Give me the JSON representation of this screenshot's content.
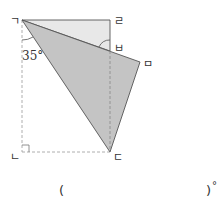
{
  "diagram": {
    "type": "folded-rectangle",
    "vertices": {
      "g": {
        "label": "ㄱ",
        "x": 22,
        "y": 20
      },
      "r": {
        "label": "ㄹ",
        "x": 110,
        "y": 20
      },
      "b": {
        "label": "ㅂ",
        "x": 110,
        "y": 51
      },
      "m": {
        "label": "ㅁ",
        "x": 140,
        "y": 62
      },
      "d": {
        "label": "ㄷ",
        "x": 110,
        "y": 152
      },
      "n": {
        "label": "ㄴ",
        "x": 22,
        "y": 152
      }
    },
    "angle_label": "35°",
    "colors": {
      "light_fill": "#e8e8e8",
      "dark_fill": "#c4c4c4",
      "stroke": "#555555",
      "dashed": "#999999"
    }
  },
  "answer": {
    "open_paren": "(",
    "close_paren": ")",
    "unit": "°"
  }
}
